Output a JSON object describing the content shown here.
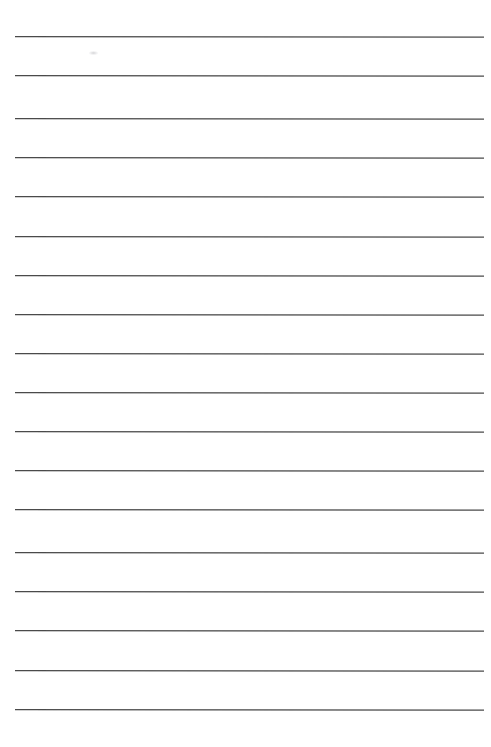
{
  "document": {
    "type": "ruled-paper",
    "title": "Blank Lined Paper",
    "description": "A blank sheet of ruled writing paper with evenly spaced horizontal rules and no written content.",
    "page_width_px": 491,
    "page_height_px": 747,
    "background_color": "#ffffff",
    "text_content": "",
    "margins": {
      "top_px": 36,
      "bottom_px": 38,
      "left_px": 15,
      "right_px": 7
    }
  },
  "ruling": {
    "line_color": "#4a4a4a",
    "line_thickness_px": 1.3,
    "line_spacing_px": 39.3,
    "line_start_x_px": 15,
    "line_end_x_px": 484,
    "line_width_px": 469,
    "first_line_y_px": 36,
    "last_line_y_px": 709,
    "line_count": 18,
    "tilt_deg": 0.06,
    "lines": [
      {
        "index": 1,
        "y": 36,
        "x1": 15,
        "x2": 484,
        "color": "#4a4a4a"
      },
      {
        "index": 2,
        "y": 75,
        "x1": 15,
        "x2": 484,
        "color": "#4a4a4a"
      },
      {
        "index": 3,
        "y": 118,
        "x1": 15,
        "x2": 484,
        "color": "#4a4a4a"
      },
      {
        "index": 4,
        "y": 157,
        "x1": 15,
        "x2": 484,
        "color": "#4a4a4a"
      },
      {
        "index": 5,
        "y": 196,
        "x1": 15,
        "x2": 484,
        "color": "#4a4a4a"
      },
      {
        "index": 6,
        "y": 236,
        "x1": 15,
        "x2": 484,
        "color": "#4a4a4a"
      },
      {
        "index": 7,
        "y": 275,
        "x1": 15,
        "x2": 484,
        "color": "#4a4a4a"
      },
      {
        "index": 8,
        "y": 314,
        "x1": 15,
        "x2": 484,
        "color": "#4a4a4a"
      },
      {
        "index": 9,
        "y": 353,
        "x1": 15,
        "x2": 484,
        "color": "#4a4a4a"
      },
      {
        "index": 10,
        "y": 392,
        "x1": 15,
        "x2": 484,
        "color": "#4a4a4a"
      },
      {
        "index": 11,
        "y": 431,
        "x1": 15,
        "x2": 484,
        "color": "#4a4a4a"
      },
      {
        "index": 12,
        "y": 470,
        "x1": 15,
        "x2": 484,
        "color": "#4a4a4a"
      },
      {
        "index": 13,
        "y": 509,
        "x1": 15,
        "x2": 484,
        "color": "#4a4a4a"
      },
      {
        "index": 14,
        "y": 552,
        "x1": 15,
        "x2": 484,
        "color": "#4a4a4a"
      },
      {
        "index": 15,
        "y": 591,
        "x1": 15,
        "x2": 484,
        "color": "#4a4a4a"
      },
      {
        "index": 16,
        "y": 630,
        "x1": 15,
        "x2": 484,
        "color": "#4a4a4a"
      },
      {
        "index": 17,
        "y": 670,
        "x1": 15,
        "x2": 484,
        "color": "#4a4a4a"
      },
      {
        "index": 18,
        "y": 709,
        "x1": 15,
        "x2": 484,
        "color": "#4a4a4a"
      }
    ]
  },
  "artifacts": [
    {
      "name": "faint-scuff-mark",
      "x": 89,
      "y": 51,
      "width": 9,
      "height": 4,
      "color": "#aaaaaf"
    }
  ]
}
